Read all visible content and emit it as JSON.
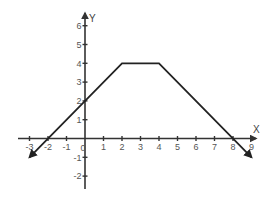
{
  "chart_data": {
    "type": "line",
    "title": "",
    "xlabel": "X",
    "ylabel": "Y",
    "xlim": [
      -3.6,
      9.2
    ],
    "ylim": [
      -2.6,
      6.6
    ],
    "grid": false,
    "x_ticks": [
      -3,
      -2,
      -1,
      0,
      1,
      2,
      3,
      4,
      5,
      6,
      7,
      8,
      9
    ],
    "y_ticks": [
      -2,
      -1,
      1,
      2,
      3,
      4,
      5,
      6
    ],
    "x_tick_labels": [
      "-3",
      "-2",
      "-1",
      "0",
      "1",
      "2",
      "3",
      "4",
      "5",
      "6",
      "7",
      "8",
      "9"
    ],
    "y_tick_labels": [
      "-2",
      "-1",
      "1",
      "2",
      "3",
      "4",
      "5",
      "6"
    ],
    "origin_label": "0",
    "series": [
      {
        "name": "piecewise linear function",
        "points": [
          [
            -3,
            -1
          ],
          [
            2,
            4
          ],
          [
            4,
            4
          ],
          [
            9,
            -1
          ]
        ],
        "arrow_ends": true,
        "color": "#222222"
      }
    ],
    "key_points": {
      "x_intercepts": [
        -2,
        8
      ],
      "y_intercept": 2,
      "plateau": {
        "from": 2,
        "to": 4,
        "y": 4
      }
    }
  },
  "colors": {
    "axis": "#333333",
    "line": "#222222",
    "label": "#555555"
  }
}
